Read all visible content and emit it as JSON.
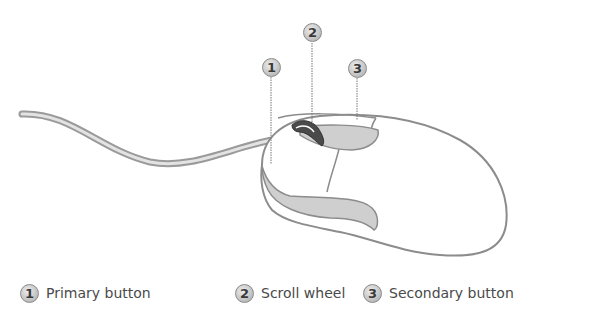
{
  "diagram": {
    "callouts": [
      {
        "number": "1",
        "x": 262,
        "y": 58
      },
      {
        "number": "2",
        "x": 303,
        "y": 23
      },
      {
        "number": "3",
        "x": 348,
        "y": 59
      }
    ],
    "legend": [
      {
        "number": "1",
        "label": "Primary button"
      },
      {
        "number": "2",
        "label": "Scroll wheel"
      },
      {
        "number": "3",
        "label": "Secondary button"
      }
    ],
    "colors": {
      "outline": "#8c8c8c",
      "accent_fill": "#cfcfcf",
      "wheel": "#4a4a4a",
      "text": "#4a4a4a"
    }
  }
}
